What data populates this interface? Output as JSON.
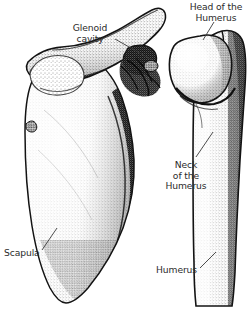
{
  "figure": {
    "background_color": "#ffffff",
    "ink_color": "#1a1a1a",
    "label_color": "#2b2b2b",
    "style": "stippled pen-and-ink anatomical line drawing",
    "width": 252,
    "height": 322
  },
  "labels": {
    "head_of_humerus": "Head of the\nHumerus",
    "glenoid_cavity": "Glenoid\ncavity",
    "neck_of_humerus": "Neck\nof the\nHumerus",
    "scapula": "Scapula",
    "humerus": "Humerus"
  },
  "structures": [
    {
      "name": "scapula",
      "label": "Scapula",
      "side": "left"
    },
    {
      "name": "scapular-spine",
      "label": "",
      "side": "left"
    },
    {
      "name": "acromion",
      "label": "",
      "side": "left"
    },
    {
      "name": "coracoid-process",
      "label": "",
      "side": "left"
    },
    {
      "name": "glenoid-cavity",
      "label": "Glenoid cavity",
      "side": "left"
    },
    {
      "name": "humerus",
      "label": "Humerus",
      "side": "right"
    },
    {
      "name": "humeral-head",
      "label": "Head of the Humerus",
      "side": "right"
    },
    {
      "name": "greater-tubercle",
      "label": "",
      "side": "right"
    },
    {
      "name": "humeral-neck",
      "label": "Neck of the Humerus",
      "side": "right"
    }
  ]
}
